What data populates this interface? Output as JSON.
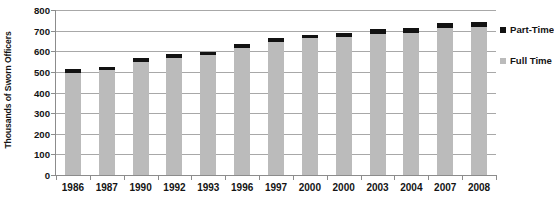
{
  "chart_data": {
    "type": "bar",
    "subtype": "stacked-bar",
    "title": "",
    "xlabel": "",
    "ylabel": "Thousands of Sworn Officers",
    "ylim": [
      0,
      800
    ],
    "ytick_step": 100,
    "yticks": [
      "800",
      "700",
      "600",
      "500",
      "400",
      "300",
      "200",
      "100",
      "0"
    ],
    "ytick_values": [
      800,
      700,
      600,
      500,
      400,
      300,
      200,
      100,
      0
    ],
    "grid": true,
    "legend_position": "right",
    "categories": [
      "1986",
      "1987",
      "1990",
      "1992",
      "1993",
      "1996",
      "1997",
      "2000",
      "2000",
      "2003",
      "2004",
      "2007",
      "2008"
    ],
    "series": [
      {
        "name": "Full Time",
        "color": "#bbbbbb",
        "values": [
          497,
          508,
          547,
          569,
          581,
          615,
          645,
          662,
          667,
          686,
          690,
          712,
          718
        ]
      },
      {
        "name": "Part-Time",
        "color": "#121212",
        "values": [
          16,
          16,
          18,
          16,
          17,
          18,
          20,
          19,
          20,
          21,
          21,
          24,
          25
        ]
      }
    ],
    "totals": [
      513,
      524,
      565,
      585,
      598,
      633,
      665,
      681,
      687,
      707,
      711,
      736,
      743
    ]
  },
  "legend": {
    "items": [
      {
        "label": "Part-Time",
        "color": "#121212"
      },
      {
        "label": "Full Time",
        "color": "#bbbbbb"
      }
    ]
  }
}
